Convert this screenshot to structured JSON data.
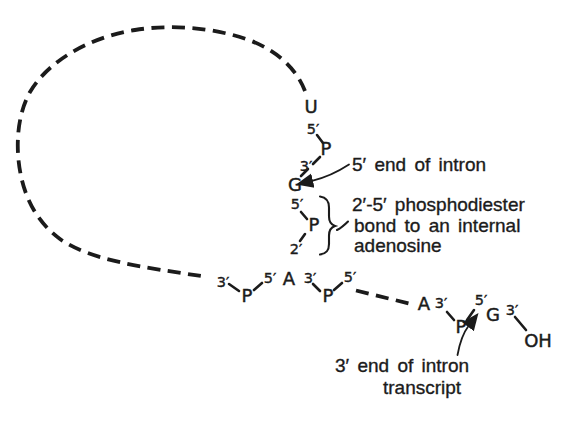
{
  "diagram": {
    "top_chain": {
      "u": "U",
      "u_five_prime": "5′",
      "p_upper": "P",
      "three_prime": "3′",
      "g": "G",
      "g_five_prime": "5′",
      "p_lower": "P",
      "two_prime": "2′"
    },
    "branch_point": {
      "left_three_prime": "3′",
      "left_p": "P",
      "left_five_prime": "5′",
      "adenosine": "A",
      "right_three_prime": "3′",
      "right_p": "P",
      "right_five_prime": "5′"
    },
    "three_end_tail": {
      "a": "A",
      "a_three_prime": "3′",
      "p": "P",
      "g_five_prime": "5′",
      "g": "G",
      "g_three_prime": "3′",
      "oh": "OH"
    },
    "annotations": {
      "five_end": "5′ end of intron",
      "phospho_line1": "2′-5′ phosphodiester",
      "phospho_line2": "bond to an internal",
      "phospho_line3": "adenosine",
      "three_end_line1": "3′ end of intron",
      "three_end_line2": "transcript"
    },
    "colors": {
      "ink": "#1b1b1b",
      "background": "#ffffff"
    }
  }
}
